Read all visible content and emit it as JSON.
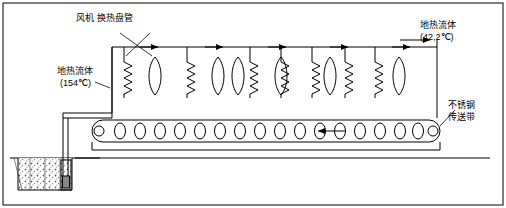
{
  "diagram": {
    "labels": {
      "fan_coil": "风机 换热盘管",
      "geothermal_inlet_line1": "地热流体",
      "geothermal_inlet_line2": "(154℃)",
      "geothermal_outlet_line1": "地热流体",
      "geothermal_outlet_line2": "(42,2℃)",
      "conveyor_line1": "不锈钢",
      "conveyor_line2": "传送带"
    },
    "components": {
      "fan_count": 6,
      "coil_count": 7,
      "roller_count": 16,
      "well_label": ""
    },
    "colors": {
      "line": "#000000",
      "ground_hatch": "#555555",
      "background": "#ffffff"
    }
  }
}
